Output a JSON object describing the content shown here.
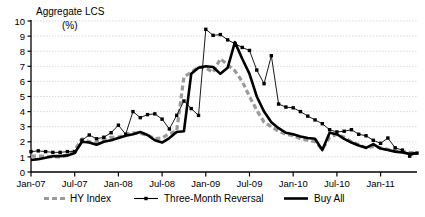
{
  "chart_data": {
    "type": "line",
    "title": "Aggregate LCS",
    "subtitle": "(%)",
    "xlabel": "",
    "ylabel": "",
    "ylim": [
      0,
      10
    ],
    "ytick_labels": [
      "0",
      "1",
      "2",
      "3",
      "4",
      "5",
      "6",
      "7",
      "8",
      "9",
      "10"
    ],
    "ytick_values": [
      0,
      1,
      2,
      3,
      4,
      5,
      6,
      7,
      8,
      9,
      10
    ],
    "grid": true,
    "legend_position": "bottom",
    "xtick_labels": [
      "Jan-07",
      "Jul-07",
      "Jan-08",
      "Jul-08",
      "Jan-09",
      "Jul-09",
      "Jan-10",
      "Jul-10",
      "Jan-11"
    ],
    "x": [
      "Jan-07",
      "Feb-07",
      "Mar-07",
      "Apr-07",
      "May-07",
      "Jun-07",
      "Jul-07",
      "Aug-07",
      "Sep-07",
      "Oct-07",
      "Nov-07",
      "Dec-07",
      "Jan-08",
      "Feb-08",
      "Mar-08",
      "Apr-08",
      "May-08",
      "Jun-08",
      "Jul-08",
      "Aug-08",
      "Sep-08",
      "Oct-08",
      "Nov-08",
      "Dec-08",
      "Jan-09",
      "Feb-09",
      "Mar-09",
      "Apr-09",
      "May-09",
      "Jun-09",
      "Jul-09",
      "Aug-09",
      "Sep-09",
      "Oct-09",
      "Nov-09",
      "Dec-09",
      "Jan-10",
      "Feb-10",
      "Mar-10",
      "Apr-10",
      "May-10",
      "Jun-10",
      "Jul-10",
      "Aug-10",
      "Sep-10",
      "Oct-10",
      "Nov-10",
      "Dec-10",
      "Jan-11",
      "Feb-11",
      "Mar-11",
      "Apr-11",
      "May-11",
      "Jun-11"
    ],
    "series": [
      {
        "name": "HY Index",
        "style": "dashed",
        "color": "#9a9a9a",
        "width": 3.2,
        "values": [
          1.05,
          1.05,
          1.05,
          1.0,
          1.0,
          1.1,
          1.45,
          2.2,
          2.0,
          1.95,
          2.15,
          2.3,
          2.3,
          2.5,
          2.6,
          2.55,
          2.45,
          2.2,
          2.25,
          2.55,
          2.7,
          6.3,
          6.6,
          6.95,
          6.9,
          6.6,
          7.5,
          7.1,
          6.7,
          6.0,
          5.0,
          4.1,
          3.3,
          3.0,
          2.7,
          2.5,
          2.4,
          2.2,
          2.1,
          2.0,
          1.5,
          2.3,
          2.5,
          2.3,
          2.0,
          1.8,
          1.6,
          1.7,
          1.6,
          1.5,
          1.4,
          1.35,
          1.3,
          1.25
        ]
      },
      {
        "name": "Three-Month Reversal",
        "style": "marker-line",
        "color": "#000000",
        "width": 0.9,
        "marker": "square",
        "values": [
          1.35,
          1.4,
          1.35,
          1.3,
          1.3,
          1.35,
          1.35,
          2.1,
          2.45,
          2.2,
          2.3,
          2.6,
          3.1,
          2.5,
          4.0,
          3.6,
          3.8,
          3.85,
          3.5,
          2.85,
          3.75,
          4.7,
          4.2,
          3.75,
          9.45,
          9.05,
          9.1,
          8.75,
          8.5,
          8.25,
          8.05,
          6.75,
          5.85,
          7.7,
          4.5,
          4.3,
          4.25,
          4.0,
          3.7,
          3.45,
          3.2,
          2.8,
          2.65,
          2.7,
          2.8,
          2.5,
          2.4,
          2.1,
          1.9,
          2.25,
          1.6,
          1.45,
          1.05,
          1.25
        ]
      },
      {
        "name": "Buy All",
        "style": "solid",
        "color": "#000000",
        "width": 2.6,
        "values": [
          0.8,
          0.85,
          0.95,
          1.05,
          1.05,
          1.1,
          1.25,
          2.0,
          1.95,
          1.8,
          2.0,
          2.1,
          2.25,
          2.4,
          2.5,
          2.65,
          2.45,
          2.1,
          1.95,
          2.25,
          2.65,
          2.7,
          6.5,
          6.9,
          7.0,
          6.95,
          6.5,
          6.9,
          8.6,
          7.5,
          6.5,
          5.0,
          4.0,
          3.3,
          2.9,
          2.6,
          2.5,
          2.35,
          2.25,
          2.2,
          1.45,
          2.6,
          2.5,
          2.2,
          1.95,
          1.75,
          1.6,
          1.85,
          1.55,
          1.45,
          1.35,
          1.3,
          1.2,
          1.25
        ]
      }
    ]
  }
}
